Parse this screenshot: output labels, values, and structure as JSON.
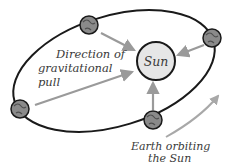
{
  "diagram": {
    "sun": {
      "label": "Sun",
      "fill": "#e6e6e6"
    },
    "pull_label": [
      "Direction of",
      "gravitational",
      "pull"
    ],
    "orbit_label": [
      "Earth orbiting",
      "the Sun"
    ],
    "colors": {
      "orbit": "#1a1a1a",
      "arrow": "#9a9a9a",
      "text": "#3a3a3a",
      "earth": "#8a8a8a"
    },
    "earths": [
      {
        "name": "earth-top"
      },
      {
        "name": "earth-right"
      },
      {
        "name": "earth-left"
      },
      {
        "name": "earth-bottom"
      }
    ]
  }
}
